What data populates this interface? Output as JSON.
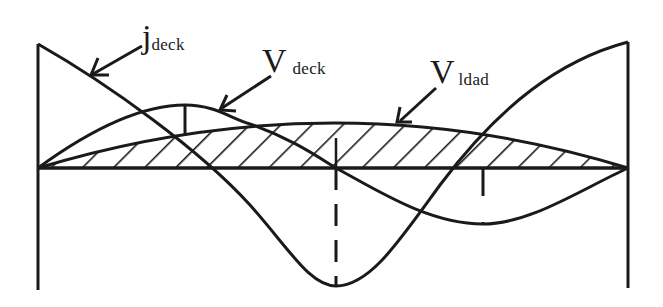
{
  "diagram": {
    "type": "structural-influence-diagram",
    "colors": {
      "line": "#1a1a1a",
      "background": "#ffffff"
    },
    "labels": {
      "j_deck": {
        "main": "j",
        "sub": "deck"
      },
      "v_deck": {
        "main": "V",
        "sub": "deck"
      },
      "v_load": {
        "main": "V",
        "sub": "ldad"
      }
    },
    "curves": [
      {
        "id": "j_deck",
        "description": "cosine-shaped curve from top-left to bottom-center to top-right"
      },
      {
        "id": "v_deck",
        "description": "sinusoidal curve, positive peak at left third, negative trough at right third"
      },
      {
        "id": "v_load",
        "description": "hatched parabolic area above baseline"
      }
    ],
    "markers": [
      {
        "type": "solid-vertical",
        "at": "v_deck positive peak"
      },
      {
        "type": "dashed-vertical",
        "at": "midspan"
      },
      {
        "type": "dashed-vertical",
        "at": "v_deck negative trough"
      }
    ]
  }
}
